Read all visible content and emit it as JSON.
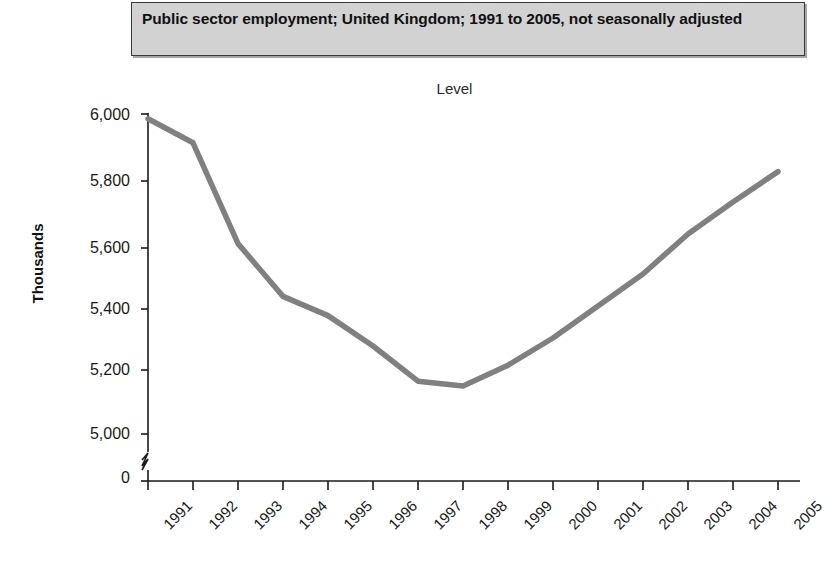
{
  "title": {
    "text": "Public sector employment; United Kingdom; 1991 to 2005, not seasonally adjusted",
    "background": "#d2d2d2",
    "border": "#3a3a3a"
  },
  "subtitle": "Level",
  "axes": {
    "ylabel": "Thousands",
    "ytick_labels": [
      "6,000",
      "5,800",
      "5,600",
      "5,400",
      "5,200",
      "5,000",
      "0"
    ],
    "ytick_values": [
      6000,
      5800,
      5600,
      5400,
      5200,
      5000,
      0
    ],
    "axis_break": true,
    "axis_break_note": "zigzag break between 0 and 5,000",
    "xtick_labels": [
      "1991",
      "1992",
      "1993",
      "1994",
      "1995",
      "1996",
      "1997",
      "1998",
      "1999",
      "2000",
      "2001",
      "2002",
      "2003",
      "2004",
      "2005"
    ],
    "xlabel": ""
  },
  "colors": {
    "line": "#808080",
    "axis": "#1a1a1a",
    "text": "#1a1a1a",
    "background": "#ffffff"
  },
  "chart_data": {
    "type": "line",
    "title": "Public sector employment; United Kingdom; 1991 to 2005, not seasonally adjusted",
    "subtitle": "Level",
    "xlabel": "",
    "ylabel": "Thousands",
    "x": [
      1991,
      1992,
      1993,
      1994,
      1995,
      1996,
      1997,
      1998,
      1999,
      2000,
      2001,
      2002,
      2003,
      2004,
      2005
    ],
    "categories": [
      "1991",
      "1992",
      "1993",
      "1994",
      "1995",
      "1996",
      "1997",
      "1998",
      "1999",
      "2000",
      "2001",
      "2002",
      "2003",
      "2004",
      "2005"
    ],
    "series": [
      {
        "name": "Public sector employment",
        "color": "#808080",
        "values": [
          5985,
          5910,
          5595,
          5430,
          5370,
          5275,
          5165,
          5150,
          5215,
          5300,
          5400,
          5500,
          5625,
          5725,
          5820
        ]
      }
    ],
    "ylim": [
      5000,
      6000
    ],
    "ytick_values": [
      5000,
      5200,
      5400,
      5600,
      5800,
      6000
    ],
    "axis_break_below": 5000,
    "grid": false,
    "legend": false,
    "markers": false,
    "note": "Line starts near 5,985 thousand in 1991, falls to a trough of about 5,150 thousand in 1998, then rises to about 5,820 thousand in 2005."
  }
}
